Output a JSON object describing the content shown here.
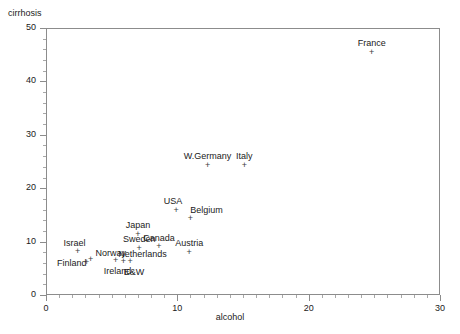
{
  "chart_data": {
    "type": "scatter",
    "title": "",
    "xlabel": "alcohol",
    "ylabel": "cirrhosis",
    "xlim": [
      0,
      30
    ],
    "ylim": [
      0,
      50
    ],
    "xticks": [
      0,
      10,
      20,
      30
    ],
    "yticks": [
      0,
      10,
      20,
      30,
      40,
      50
    ],
    "x_minor_step": 1,
    "y_minor_step": 2,
    "grid": false,
    "legend": "none",
    "marker": "+",
    "marker_color": "#3d3d3d",
    "frame_color": "#8c8c8c",
    "points": [
      {
        "label": "France",
        "x": 24.8,
        "y": 45.5,
        "label_dx": 0,
        "label_dy": -9
      },
      {
        "label": "W.Germany",
        "x": 12.3,
        "y": 24.3,
        "label_dx": 0,
        "label_dy": -9
      },
      {
        "label": "Italy",
        "x": 15.1,
        "y": 24.3,
        "label_dx": 0,
        "label_dy": -9
      },
      {
        "label": "USA",
        "x": 9.9,
        "y": 15.9,
        "label_dx": -3,
        "label_dy": -9
      },
      {
        "label": "Belgium",
        "x": 11.0,
        "y": 14.4,
        "label_dx": 16,
        "label_dy": -8
      },
      {
        "label": "Japan",
        "x": 7.0,
        "y": 11.4,
        "label_dx": 0,
        "label_dy": -9
      },
      {
        "label": "Canada",
        "x": 8.6,
        "y": 9.0,
        "label_dx": 0,
        "label_dy": -9
      },
      {
        "label": "Sweden",
        "x": 7.1,
        "y": 8.8,
        "label_dx": 0,
        "label_dy": -9
      },
      {
        "label": "Austria",
        "x": 10.9,
        "y": 8.0,
        "label_dx": 0,
        "label_dy": -9
      },
      {
        "label": "Netherlands",
        "x": 5.9,
        "y": 6.3,
        "label_dx": 19,
        "label_dy": -7
      },
      {
        "label": "Israel",
        "x": 2.4,
        "y": 8.1,
        "label_dx": -3,
        "label_dy": -9
      },
      {
        "label": "Norway",
        "x": 3.4,
        "y": 6.7,
        "label_dx": 20,
        "label_dy": -6
      },
      {
        "label": "Finland",
        "x": 3.1,
        "y": 6.1,
        "label_dx": -15,
        "label_dy": 1
      },
      {
        "label": "Ireland",
        "x": 5.3,
        "y": 6.4,
        "label_dx": 2,
        "label_dy": 10
      },
      {
        "label": "E&W",
        "x": 6.4,
        "y": 6.2,
        "label_dx": 4,
        "label_dy": 10
      }
    ]
  }
}
